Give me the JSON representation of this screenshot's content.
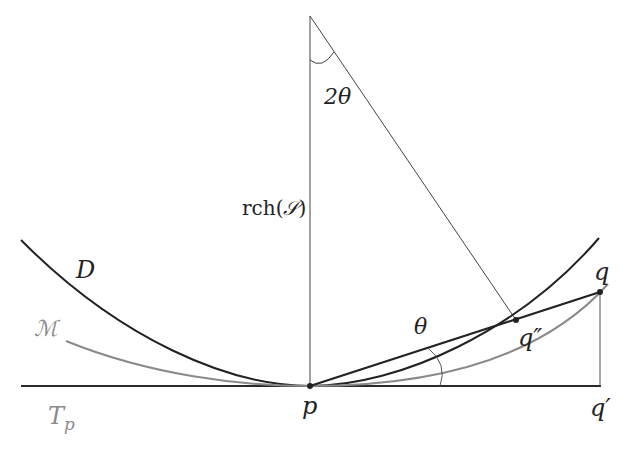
{
  "diagram": {
    "labels": {
      "two_theta": "2θ",
      "rch_prefix": "rch(",
      "rch_set": "𝒮",
      "rch_suffix": ")",
      "D": "D",
      "M": "ℳ",
      "Tp_main": "T",
      "Tp_sub": "p",
      "p": "p",
      "theta": "θ",
      "q": "q",
      "q_double_prime": "q″",
      "q_prime": "q′"
    },
    "points": {
      "apex": [
        310,
        16
      ],
      "p": [
        310,
        386
      ],
      "q": [
        600,
        292
      ],
      "q_double_prime": [
        516,
        320
      ],
      "q_prime": [
        601,
        386
      ]
    },
    "colors": {
      "ink": "#222222",
      "thin": "#333333",
      "gray_curve": "#8a8a8a",
      "gray_label": "#8a8a8a"
    }
  }
}
